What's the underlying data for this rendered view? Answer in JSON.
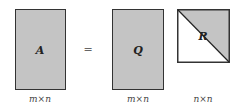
{
  "diagram": {
    "matrices": [
      {
        "name": "A",
        "dims": "m×n",
        "fill": "#c4c4c4"
      },
      {
        "name": "Q",
        "dims": "m×n",
        "fill": "#c4c4c4"
      },
      {
        "name": "R",
        "dims": "n×n",
        "fill": "#c4c4c4",
        "shape": "upper-triangular"
      }
    ],
    "operator": "="
  }
}
